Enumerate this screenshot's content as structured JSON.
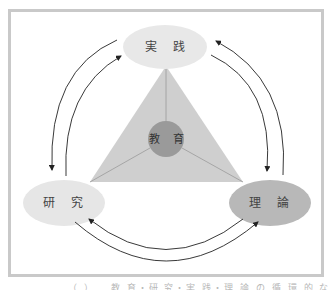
{
  "diagram": {
    "center": {
      "label": "教 育",
      "color": "#9a9a9a"
    },
    "nodes": [
      {
        "id": "practice",
        "label": "実 践",
        "position": "top",
        "color": "#e8e8e8"
      },
      {
        "id": "research",
        "label": "研 究",
        "position": "bottom-left",
        "color": "#e6e6e6"
      },
      {
        "id": "theory",
        "label": "理 論",
        "position": "bottom-right",
        "color": "#b8b8b8"
      }
    ],
    "triangle": {
      "color": "#cfcfcf"
    },
    "arrows": [
      {
        "from": "research",
        "to": "practice",
        "side": "left-inner"
      },
      {
        "from": "practice",
        "to": "research",
        "side": "left-outer"
      },
      {
        "from": "theory",
        "to": "practice",
        "side": "right-outer"
      },
      {
        "from": "practice",
        "to": "theory",
        "side": "right-inner"
      },
      {
        "from": "theory",
        "to": "research",
        "side": "bottom-inner"
      },
      {
        "from": "research",
        "to": "theory",
        "side": "bottom-outer"
      }
    ],
    "frame_color": "#c9c9c9"
  },
  "caption": "（ ） 　教 育・研 究・実 践・理 論 の 循 環 的 な 関 係"
}
